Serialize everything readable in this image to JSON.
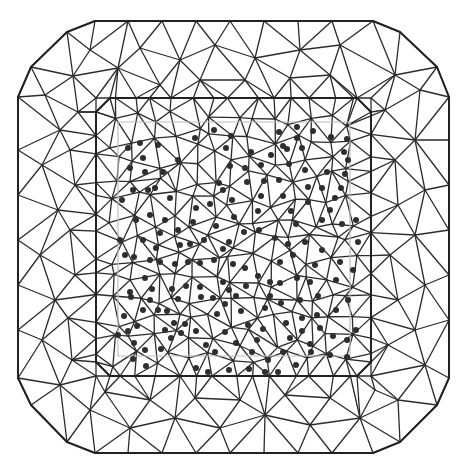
{
  "diagram": {
    "type": "triangular-mesh",
    "colors": {
      "line": "#2b2b2b",
      "boundary": "#222222",
      "faint": "#bdbdbd",
      "dot": "#2e2e2e",
      "background": "#ffffff"
    },
    "outer_boundary": [
      [
        95,
        21
      ],
      [
        373,
        21
      ],
      [
        400,
        32
      ],
      [
        437,
        67
      ],
      [
        449,
        97
      ],
      [
        449,
        378
      ],
      [
        437,
        405
      ],
      [
        400,
        442
      ],
      [
        373,
        453
      ],
      [
        95,
        453
      ],
      [
        67,
        442
      ],
      [
        31,
        405
      ],
      [
        18,
        378
      ],
      [
        18,
        97
      ],
      [
        31,
        67
      ],
      [
        67,
        32
      ]
    ],
    "inner_boundary": [
      [
        110,
        98
      ],
      [
        357,
        98
      ],
      [
        371,
        112
      ],
      [
        371,
        362
      ],
      [
        357,
        376
      ],
      [
        110,
        376
      ],
      [
        96,
        362
      ],
      [
        96,
        112
      ]
    ],
    "faint_boundary": [
      [
        118,
        122
      ],
      [
        350,
        122
      ],
      [
        350,
        356
      ],
      [
        118,
        356
      ]
    ],
    "outer_nodes": [
      [
        128,
        21
      ],
      [
        162,
        21
      ],
      [
        196,
        21
      ],
      [
        230,
        21
      ],
      [
        264,
        21
      ],
      [
        298,
        21
      ],
      [
        332,
        21
      ],
      [
        373,
        21
      ],
      [
        400,
        32
      ],
      [
        437,
        67
      ],
      [
        449,
        97
      ],
      [
        449,
        140
      ],
      [
        449,
        185
      ],
      [
        449,
        230
      ],
      [
        449,
        275
      ],
      [
        449,
        320
      ],
      [
        449,
        378
      ],
      [
        437,
        405
      ],
      [
        400,
        442
      ],
      [
        373,
        453
      ],
      [
        332,
        453
      ],
      [
        298,
        453
      ],
      [
        264,
        453
      ],
      [
        230,
        453
      ],
      [
        196,
        453
      ],
      [
        162,
        453
      ],
      [
        128,
        453
      ],
      [
        95,
        453
      ],
      [
        67,
        442
      ],
      [
        31,
        405
      ],
      [
        18,
        378
      ],
      [
        18,
        330
      ],
      [
        18,
        285
      ],
      [
        18,
        240
      ],
      [
        18,
        195
      ],
      [
        18,
        150
      ],
      [
        18,
        97
      ],
      [
        31,
        67
      ],
      [
        67,
        32
      ],
      [
        95,
        21
      ]
    ],
    "ring_nodes": [
      [
        90,
        50
      ],
      [
        140,
        48
      ],
      [
        180,
        60
      ],
      [
        215,
        45
      ],
      [
        255,
        58
      ],
      [
        300,
        50
      ],
      [
        340,
        45
      ],
      [
        395,
        75
      ],
      [
        420,
        90
      ],
      [
        415,
        140
      ],
      [
        425,
        190
      ],
      [
        415,
        235
      ],
      [
        425,
        285
      ],
      [
        415,
        330
      ],
      [
        425,
        365
      ],
      [
        398,
        400
      ],
      [
        360,
        418
      ],
      [
        310,
        425
      ],
      [
        265,
        415
      ],
      [
        220,
        428
      ],
      [
        175,
        418
      ],
      [
        130,
        428
      ],
      [
        90,
        410
      ],
      [
        60,
        385
      ],
      [
        42,
        340
      ],
      [
        55,
        300
      ],
      [
        40,
        255
      ],
      [
        58,
        210
      ],
      [
        42,
        165
      ],
      [
        60,
        130
      ],
      [
        45,
        95
      ],
      [
        73,
        76
      ],
      [
        118,
        68
      ],
      [
        160,
        85
      ],
      [
        200,
        80
      ],
      [
        245,
        80
      ],
      [
        290,
        78
      ],
      [
        330,
        75
      ],
      [
        385,
        110
      ],
      [
        395,
        160
      ],
      [
        398,
        205
      ],
      [
        390,
        255
      ],
      [
        398,
        300
      ],
      [
        388,
        345
      ],
      [
        375,
        390
      ],
      [
        330,
        398
      ],
      [
        285,
        395
      ],
      [
        240,
        400
      ],
      [
        195,
        398
      ],
      [
        150,
        400
      ],
      [
        105,
        392
      ],
      [
        72,
        360
      ],
      [
        68,
        318
      ],
      [
        75,
        275
      ],
      [
        70,
        230
      ],
      [
        75,
        185
      ],
      [
        70,
        150
      ],
      [
        78,
        112
      ]
    ],
    "inner_grid": {
      "x0": 96,
      "y0": 98,
      "x1": 371,
      "y1": 376,
      "cols": 14,
      "rows": 14,
      "jitter": 7
    },
    "dots": [
      [
        128,
        148
      ],
      [
        140,
        143
      ],
      [
        143,
        158
      ],
      [
        158,
        145
      ],
      [
        163,
        172
      ],
      [
        130,
        168
      ],
      [
        145,
        172
      ],
      [
        155,
        188
      ],
      [
        133,
        190
      ],
      [
        148,
        190
      ],
      [
        122,
        200
      ],
      [
        170,
        198
      ],
      [
        178,
        160
      ],
      [
        195,
        138
      ],
      [
        214,
        130
      ],
      [
        226,
        148
      ],
      [
        231,
        136
      ],
      [
        219,
        183
      ],
      [
        230,
        166
      ],
      [
        251,
        152
      ],
      [
        283,
        146
      ],
      [
        297,
        127
      ],
      [
        313,
        131
      ],
      [
        331,
        137
      ],
      [
        347,
        139
      ],
      [
        344,
        152
      ],
      [
        348,
        160
      ],
      [
        345,
        174
      ],
      [
        341,
        188
      ],
      [
        330,
        210
      ],
      [
        322,
        220
      ],
      [
        322,
        188
      ],
      [
        327,
        172
      ],
      [
        305,
        170
      ],
      [
        289,
        164
      ],
      [
        287,
        149
      ],
      [
        302,
        148
      ],
      [
        308,
        187
      ],
      [
        308,
        202
      ],
      [
        296,
        224
      ],
      [
        291,
        211
      ],
      [
        283,
        196
      ],
      [
        279,
        180
      ],
      [
        264,
        181
      ],
      [
        261,
        196
      ],
      [
        258,
        211
      ],
      [
        259,
        230
      ],
      [
        275,
        238
      ],
      [
        288,
        244
      ],
      [
        293,
        255
      ],
      [
        280,
        262
      ],
      [
        305,
        242
      ],
      [
        322,
        250
      ],
      [
        315,
        265
      ],
      [
        340,
        262
      ],
      [
        336,
        280
      ],
      [
        348,
        300
      ],
      [
        336,
        310
      ],
      [
        347,
        340
      ],
      [
        333,
        336
      ],
      [
        320,
        328
      ],
      [
        317,
        315
      ],
      [
        300,
        300
      ],
      [
        302,
        318
      ],
      [
        286,
        323
      ],
      [
        290,
        338
      ],
      [
        283,
        352
      ],
      [
        268,
        360
      ],
      [
        252,
        352
      ],
      [
        257,
        340
      ],
      [
        263,
        329
      ],
      [
        248,
        325
      ],
      [
        241,
        311
      ],
      [
        236,
        296
      ],
      [
        225,
        304
      ],
      [
        217,
        314
      ],
      [
        213,
        298
      ],
      [
        201,
        297
      ],
      [
        200,
        287
      ],
      [
        186,
        286
      ],
      [
        178,
        299
      ],
      [
        172,
        289
      ],
      [
        167,
        311
      ],
      [
        150,
        300
      ],
      [
        152,
        289
      ],
      [
        145,
        278
      ],
      [
        131,
        297
      ],
      [
        137,
        326
      ],
      [
        128,
        331
      ],
      [
        134,
        343
      ],
      [
        145,
        350
      ],
      [
        161,
        349
      ],
      [
        171,
        338
      ],
      [
        181,
        333
      ],
      [
        196,
        331
      ],
      [
        206,
        345
      ],
      [
        215,
        352
      ],
      [
        225,
        332
      ],
      [
        236,
        343
      ],
      [
        249,
        369
      ],
      [
        229,
        370
      ],
      [
        185,
        324
      ],
      [
        174,
        323
      ],
      [
        165,
        330
      ],
      [
        158,
        310
      ],
      [
        143,
        310
      ],
      [
        130,
        292
      ],
      [
        134,
        257
      ],
      [
        143,
        240
      ],
      [
        156,
        248
      ],
      [
        150,
        260
      ],
      [
        160,
        262
      ],
      [
        175,
        264
      ],
      [
        188,
        262
      ],
      [
        200,
        263
      ],
      [
        214,
        260
      ],
      [
        204,
        240
      ],
      [
        216,
        226
      ],
      [
        234,
        217
      ],
      [
        244,
        232
      ],
      [
        229,
        242
      ],
      [
        223,
        249
      ],
      [
        233,
        264
      ],
      [
        245,
        268
      ],
      [
        258,
        276
      ],
      [
        270,
        282
      ],
      [
        280,
        283
      ],
      [
        297,
        278
      ],
      [
        310,
        282
      ],
      [
        136,
        220
      ],
      [
        150,
        215
      ],
      [
        165,
        220
      ],
      [
        178,
        230
      ],
      [
        193,
        222
      ],
      [
        196,
        208
      ],
      [
        210,
        204
      ],
      [
        232,
        200
      ],
      [
        223,
        190
      ],
      [
        247,
        182
      ],
      [
        245,
        168
      ],
      [
        261,
        165
      ],
      [
        271,
        155
      ],
      [
        279,
        132
      ],
      [
        297,
        138
      ],
      [
        335,
        198
      ],
      [
        356,
        220
      ],
      [
        358,
        242
      ],
      [
        353,
        270
      ],
      [
        342,
        224
      ],
      [
        281,
        303
      ],
      [
        265,
        308
      ],
      [
        270,
        296
      ],
      [
        246,
        286
      ],
      [
        223,
        282
      ],
      [
        190,
        244
      ],
      [
        180,
        245
      ],
      [
        160,
        233
      ],
      [
        120,
        240
      ],
      [
        125,
        255
      ],
      [
        124,
        316
      ],
      [
        118,
        335
      ],
      [
        133,
        359
      ],
      [
        146,
        366
      ],
      [
        196,
        368
      ],
      [
        208,
        372
      ],
      [
        278,
        372
      ],
      [
        296,
        365
      ],
      [
        311,
        352
      ],
      [
        330,
        355
      ],
      [
        347,
        357
      ],
      [
        356,
        330
      ],
      [
        318,
        296
      ],
      [
        229,
        290
      ],
      [
        302,
        331
      ],
      [
        310,
        344
      ],
      [
        265,
        372
      ]
    ]
  }
}
